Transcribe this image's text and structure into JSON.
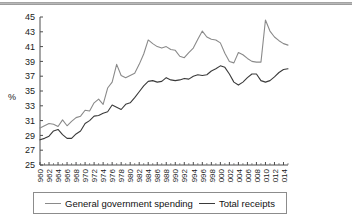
{
  "chart_data": {
    "type": "line",
    "title": "",
    "xlabel": "",
    "ylabel": "%",
    "ylim": [
      25,
      45
    ],
    "xlim": [
      1960,
      2015
    ],
    "ytick_labels": [
      "45",
      "43",
      "41",
      "39",
      "37",
      "35",
      "33",
      "31",
      "29",
      "27",
      "25"
    ],
    "ytick_values": [
      45,
      43,
      41,
      39,
      37,
      35,
      33,
      31,
      29,
      27,
      25
    ],
    "xtick_labels": [
      "1960",
      "1962",
      "1964",
      "1966",
      "1968",
      "1970",
      "1972",
      "1974",
      "1976",
      "1978",
      "1980",
      "1982",
      "1984",
      "1986",
      "1988",
      "1990",
      "1992",
      "1994",
      "1996",
      "1998",
      "2000",
      "2002",
      "2004",
      "2006",
      "2008",
      "2010",
      "2012",
      "2014"
    ],
    "xtick_values": [
      1960,
      1962,
      1964,
      1966,
      1968,
      1970,
      1972,
      1974,
      1976,
      1978,
      1980,
      1982,
      1984,
      1986,
      1988,
      1990,
      1992,
      1994,
      1996,
      1998,
      2000,
      2002,
      2004,
      2006,
      2008,
      2010,
      2012,
      2014
    ],
    "grid": false,
    "legend_position": "bottom",
    "x": [
      1960,
      1961,
      1962,
      1963,
      1964,
      1965,
      1966,
      1967,
      1968,
      1969,
      1970,
      1971,
      1972,
      1973,
      1974,
      1975,
      1976,
      1977,
      1978,
      1979,
      1980,
      1981,
      1982,
      1983,
      1984,
      1985,
      1986,
      1987,
      1988,
      1989,
      1990,
      1991,
      1992,
      1993,
      1994,
      1995,
      1996,
      1997,
      1998,
      1999,
      2000,
      2001,
      2002,
      2003,
      2004,
      2005,
      2006,
      2007,
      2008,
      2009,
      2010,
      2011,
      2012,
      2013,
      2014,
      2015
    ],
    "series": [
      {
        "name": "General government spending",
        "color": "#8a8a8a",
        "values": [
          30.0,
          30.3,
          30.6,
          30.5,
          30.2,
          31.1,
          30.3,
          30.9,
          31.4,
          31.6,
          32.4,
          32.3,
          33.4,
          33.9,
          33.2,
          35.4,
          36.2,
          38.6,
          37.1,
          36.8,
          37.1,
          37.4,
          38.6,
          40.0,
          41.9,
          41.4,
          41.0,
          40.8,
          41.0,
          40.6,
          40.5,
          39.7,
          39.5,
          40.2,
          40.8,
          42.0,
          43.1,
          42.3,
          42.0,
          41.9,
          41.5,
          40.1,
          39.0,
          38.8,
          40.2,
          39.9,
          39.4,
          39.0,
          38.9,
          38.9,
          44.6,
          43.1,
          42.3,
          41.8,
          41.4,
          41.2
        ]
      },
      {
        "name": "Total receipts",
        "color": "#3a3a3a",
        "values": [
          28.4,
          28.6,
          28.9,
          29.6,
          29.8,
          29.1,
          28.6,
          28.6,
          29.2,
          29.6,
          30.6,
          31.0,
          31.6,
          31.7,
          32.0,
          32.2,
          33.1,
          32.8,
          32.5,
          33.2,
          33.4,
          34.1,
          34.9,
          35.7,
          36.3,
          36.4,
          36.2,
          36.3,
          36.8,
          36.5,
          36.4,
          36.5,
          36.7,
          36.6,
          37.0,
          37.2,
          37.1,
          37.2,
          37.7,
          38.0,
          38.4,
          38.2,
          37.3,
          36.2,
          35.8,
          36.2,
          36.8,
          37.3,
          37.3,
          36.4,
          36.2,
          36.4,
          36.9,
          37.5,
          37.9,
          38.0
        ]
      }
    ]
  },
  "legend": {
    "items": [
      {
        "label": "General government spending",
        "color": "#8a8a8a"
      },
      {
        "label": "Total receipts",
        "color": "#3a3a3a"
      }
    ]
  },
  "axis": {
    "y_axis_title": "%"
  }
}
